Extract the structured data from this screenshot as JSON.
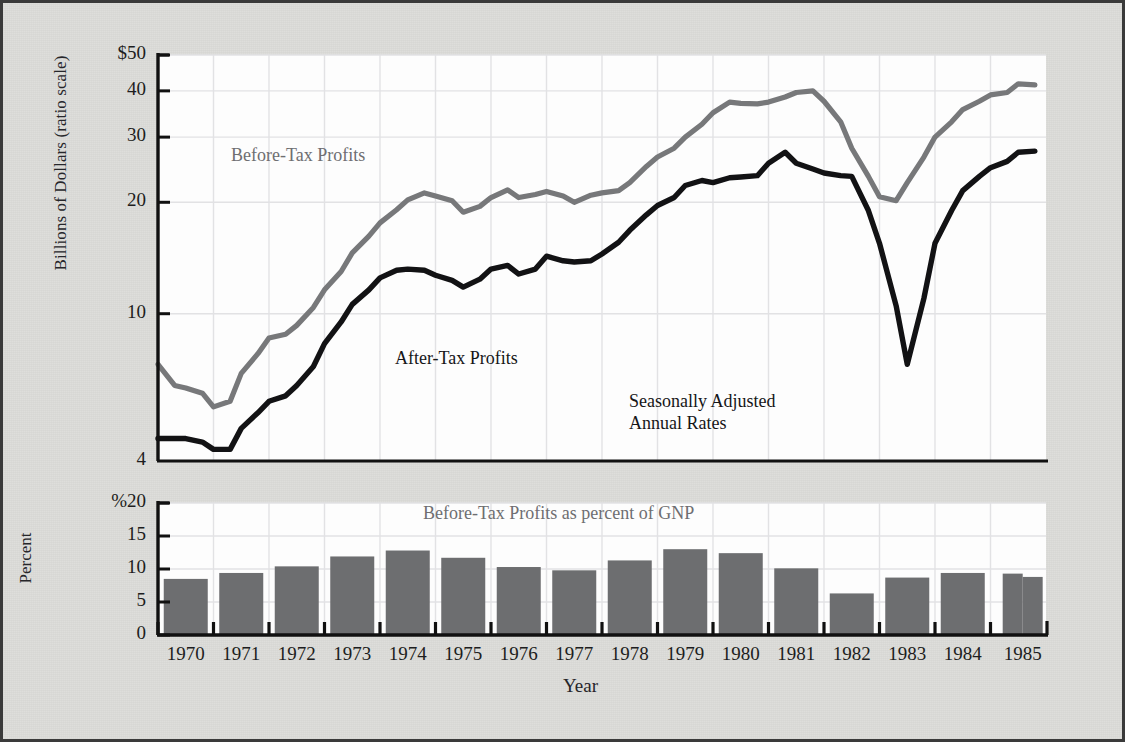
{
  "figure": {
    "y_axis_label_top": "Billions of Dollars (ratio scale)",
    "y_axis_label_bottom": "Percent",
    "x_axis_label": "Year",
    "annotations": {
      "before_tax": "Before-Tax Profits",
      "after_tax": "After-Tax Profits",
      "seasonal_note": "Seasonally Adjusted\nAnnual Rates",
      "bar_title": "Before-Tax Profits as percent of GNP"
    },
    "colors": {
      "before_tax_line": "#77787a",
      "after_tax_line": "#121214",
      "bar_fill": "#6d6e70",
      "page_background": "#dcdcd9",
      "panel_background": "#fdfdfd",
      "grid": "#e2e2e4",
      "axis": "#111111",
      "label_text": "#1d1d20"
    }
  },
  "chart_data": [
    {
      "type": "line",
      "title": "Corporate Profits, Before and After Tax",
      "xlabel": "Year",
      "ylabel": "Billions of Dollars (ratio scale)",
      "scale": "log",
      "ylim": [
        4,
        50
      ],
      "ytick_labels": [
        "$50",
        "40",
        "30",
        "20",
        "10",
        "4"
      ],
      "yticks": [
        50,
        40,
        30,
        20,
        10,
        4
      ],
      "grid": true,
      "legend_position": "inline-annotation",
      "xlim": [
        1969.6,
        1985.6
      ],
      "xtick_labels": [
        "1970",
        "1971",
        "1972",
        "1973",
        "1974",
        "1975",
        "1976",
        "1977",
        "1978",
        "1979",
        "1980",
        "1981",
        "1982",
        "1983",
        "1984",
        "1985"
      ],
      "series": [
        {
          "name": "Before-Tax Profits",
          "color": "#77787a",
          "x": [
            1969.6,
            1969.9,
            1970.1,
            1970.4,
            1970.6,
            1970.9,
            1971.1,
            1971.4,
            1971.6,
            1971.9,
            1972.1,
            1972.4,
            1972.6,
            1972.9,
            1973.1,
            1973.4,
            1973.6,
            1973.9,
            1974.1,
            1974.4,
            1974.6,
            1974.9,
            1975.1,
            1975.4,
            1975.6,
            1975.9,
            1976.1,
            1976.4,
            1976.6,
            1976.9,
            1977.1,
            1977.4,
            1977.6,
            1977.9,
            1978.1,
            1978.4,
            1978.6,
            1978.9,
            1979.1,
            1979.4,
            1979.6,
            1979.9,
            1980.1,
            1980.4,
            1980.6,
            1980.9,
            1981.1,
            1981.4,
            1981.6,
            1981.9,
            1982.1,
            1982.4,
            1982.6,
            1982.9,
            1983.1,
            1983.4,
            1983.6,
            1983.9,
            1984.1,
            1984.4,
            1984.6,
            1984.9,
            1985.1,
            1985.4
          ],
          "values": [
            7.3,
            6.4,
            6.3,
            6.1,
            5.6,
            5.8,
            6.9,
            7.8,
            8.6,
            8.8,
            9.3,
            10.4,
            11.6,
            13.0,
            14.6,
            16.2,
            17.6,
            19.1,
            20.3,
            21.2,
            20.8,
            20.2,
            18.8,
            19.5,
            20.6,
            21.6,
            20.6,
            21.0,
            21.4,
            20.8,
            20.0,
            20.9,
            21.2,
            21.5,
            22.6,
            25.0,
            26.5,
            28.0,
            30.0,
            32.5,
            34.9,
            37.3,
            37.0,
            36.9,
            37.3,
            38.5,
            39.6,
            40.0,
            37.5,
            33.0,
            28.0,
            23.5,
            20.7,
            20.2,
            22.6,
            26.5,
            30.0,
            33.0,
            35.6,
            37.5,
            39.0,
            39.6,
            41.8,
            41.5
          ]
        },
        {
          "name": "After-Tax Profits",
          "color": "#121214",
          "x": [
            1969.6,
            1969.9,
            1970.1,
            1970.4,
            1970.6,
            1970.9,
            1971.1,
            1971.4,
            1971.6,
            1971.9,
            1972.1,
            1972.4,
            1972.6,
            1972.9,
            1973.1,
            1973.4,
            1973.6,
            1973.9,
            1974.1,
            1974.4,
            1974.6,
            1974.9,
            1975.1,
            1975.4,
            1975.6,
            1975.9,
            1976.1,
            1976.4,
            1976.6,
            1976.9,
            1977.1,
            1977.4,
            1977.6,
            1977.9,
            1978.1,
            1978.4,
            1978.6,
            1978.9,
            1979.1,
            1979.4,
            1979.6,
            1979.9,
            1980.1,
            1980.4,
            1980.6,
            1980.9,
            1981.1,
            1981.4,
            1981.6,
            1981.9,
            1982.1,
            1982.4,
            1982.6,
            1982.9,
            1983.1,
            1983.4,
            1983.6,
            1983.9,
            1984.1,
            1984.4,
            1984.6,
            1984.9,
            1985.1,
            1985.4
          ],
          "values": [
            4.6,
            4.6,
            4.6,
            4.5,
            4.3,
            4.3,
            4.9,
            5.4,
            5.8,
            6.0,
            6.4,
            7.2,
            8.3,
            9.5,
            10.6,
            11.6,
            12.5,
            13.1,
            13.2,
            13.1,
            12.7,
            12.3,
            11.8,
            12.4,
            13.2,
            13.5,
            12.8,
            13.2,
            14.3,
            13.9,
            13.8,
            13.9,
            14.5,
            15.6,
            16.8,
            18.5,
            19.6,
            20.6,
            22.2,
            22.9,
            22.6,
            23.3,
            23.4,
            23.6,
            25.5,
            27.3,
            25.5,
            24.6,
            24.0,
            23.6,
            23.5,
            19.0,
            15.5,
            10.5,
            7.3,
            11.0,
            15.5,
            19.0,
            21.5,
            23.5,
            24.8,
            25.8,
            27.3,
            27.5,
            25.7
          ]
        }
      ]
    },
    {
      "type": "bar",
      "title": "Before-Tax Profits as percent of GNP",
      "xlabel": "Year",
      "ylabel": "Percent",
      "ylim": [
        0,
        20
      ],
      "ytick_labels": [
        "%20",
        "15",
        "10",
        "5",
        "0"
      ],
      "yticks": [
        20,
        15,
        10,
        5,
        0
      ],
      "grid": true,
      "categories": [
        "1970",
        "1971",
        "1972",
        "1973",
        "1974",
        "1975",
        "1976",
        "1977",
        "1978",
        "1979",
        "1980",
        "1981",
        "1982",
        "1983",
        "1984",
        "1985 Q1",
        "1985 Q2"
      ],
      "values": [
        8.5,
        9.4,
        10.4,
        11.9,
        12.8,
        11.7,
        10.3,
        9.8,
        11.3,
        13.0,
        12.4,
        10.1,
        6.3,
        8.7,
        9.4,
        9.3,
        8.8
      ],
      "bar_color": "#6d6e70"
    }
  ]
}
